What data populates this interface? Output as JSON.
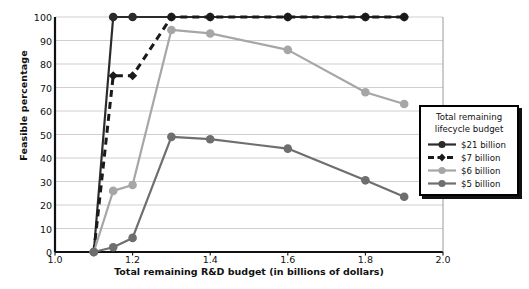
{
  "chart_data": {
    "type": "line",
    "title": "",
    "xlabel": "Total remaining R&D budget (in billions of dollars)",
    "ylabel": "Feasible percentage",
    "xlim": [
      1.0,
      2.0
    ],
    "ylim": [
      0,
      100
    ],
    "xticks": [
      "1.0",
      "1.2",
      "1.4",
      "1.6",
      "1.8",
      "2.0"
    ],
    "xtick_values": [
      1.0,
      1.2,
      1.4,
      1.6,
      1.8,
      2.0
    ],
    "yticks": [
      "0",
      "10",
      "20",
      "30",
      "40",
      "50",
      "60",
      "70",
      "80",
      "90",
      "100"
    ],
    "ytick_values": [
      0,
      10,
      20,
      30,
      40,
      50,
      60,
      70,
      80,
      90,
      100
    ],
    "grid": "horizontal",
    "legend_position": "bottom-right",
    "legend_title": "Total remaining lifecycle budget",
    "series": [
      {
        "name": "$21 billion",
        "color": "#2b2b2b",
        "dash": "solid",
        "marker": "circle",
        "x": [
          1.1,
          1.15,
          1.2,
          1.3,
          1.4,
          1.6,
          1.8,
          1.9
        ],
        "values": [
          0,
          100,
          100,
          100,
          100,
          100,
          100,
          100
        ]
      },
      {
        "name": "$7 billion",
        "color": "#1a1a1a",
        "dash": "dashed",
        "marker": "diamond",
        "x": [
          1.1,
          1.15,
          1.2,
          1.3,
          1.4,
          1.6,
          1.8,
          1.9
        ],
        "values": [
          0,
          75,
          75,
          100,
          100,
          100,
          100,
          100
        ]
      },
      {
        "name": "$6 billion",
        "color": "#a6a6a6",
        "dash": "solid",
        "marker": "circle",
        "x": [
          1.1,
          1.15,
          1.2,
          1.3,
          1.4,
          1.6,
          1.8,
          1.9
        ],
        "values": [
          0,
          26,
          28.5,
          94.5,
          93,
          86,
          68,
          63
        ]
      },
      {
        "name": "$5 billion",
        "color": "#6e6e6e",
        "dash": "solid",
        "marker": "circle",
        "x": [
          1.1,
          1.15,
          1.2,
          1.3,
          1.4,
          1.6,
          1.8,
          1.9
        ],
        "values": [
          0,
          2,
          6,
          49,
          48,
          44,
          30.5,
          23.5
        ]
      }
    ]
  },
  "legend": {
    "title_line1": "Total remaining",
    "title_line2": "lifecycle budget",
    "entries": [
      {
        "label": "$21 billion"
      },
      {
        "label": "$7 billion"
      },
      {
        "label": "$6 billion"
      },
      {
        "label": "$5 billion"
      }
    ]
  }
}
